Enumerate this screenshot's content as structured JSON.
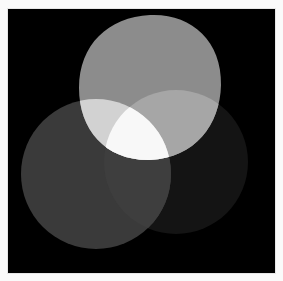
{
  "image": {
    "description": "Three overlapping soft blobs of light on a black background, forming an additive Venn-like figure",
    "background_color": "#000000",
    "border_color": "#fafafa"
  },
  "shapes": {
    "top": {
      "label": "top-blob",
      "color": "#8c8c8c",
      "cx": 150,
      "cy": 87,
      "r": 73
    },
    "left": {
      "label": "bottom-left-blob",
      "color": "#3a3a3a",
      "cx": 96,
      "cy": 174,
      "r": 75
    },
    "right": {
      "label": "bottom-right-blob",
      "color": "#141414",
      "cx": 176,
      "cy": 162,
      "r": 72
    }
  },
  "overlaps": {
    "top_left": {
      "color": "#d2d2d2"
    },
    "top_right": {
      "color": "#a6a6a6"
    },
    "left_right": {
      "color": "#3e3e3e"
    },
    "all": {
      "color": "#f8f8f8"
    }
  }
}
